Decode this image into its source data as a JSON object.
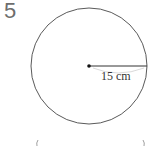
{
  "question": {
    "number": "5"
  },
  "diagram": {
    "shape": "circle",
    "radius_label": "15 cm",
    "colors": {
      "stroke": "#5a5a5a",
      "center_dot": "#111111"
    }
  }
}
